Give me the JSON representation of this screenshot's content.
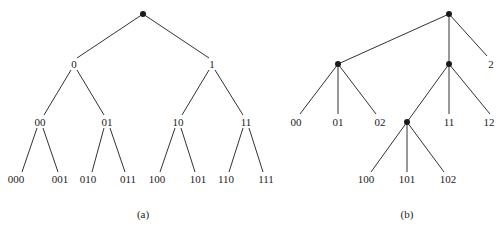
{
  "figure": {
    "panel_a": {
      "caption": "(a)",
      "type": "binary-tree",
      "root": {
        "x": 143,
        "y": 14
      },
      "nodes": [
        {
          "id": "0",
          "label": "0",
          "x": 74,
          "y": 64,
          "parent": "root"
        },
        {
          "id": "1",
          "label": "1",
          "x": 212,
          "y": 64,
          "parent": "root"
        },
        {
          "id": "00",
          "label": "00",
          "x": 40,
          "y": 122,
          "parent": "0"
        },
        {
          "id": "01",
          "label": "01",
          "x": 107,
          "y": 122,
          "parent": "0"
        },
        {
          "id": "10",
          "label": "10",
          "x": 178,
          "y": 122,
          "parent": "1"
        },
        {
          "id": "11",
          "label": "11",
          "x": 246,
          "y": 122,
          "parent": "1"
        },
        {
          "id": "000",
          "label": "000",
          "x": 16,
          "y": 180,
          "parent": "00"
        },
        {
          "id": "001",
          "label": "001",
          "x": 60,
          "y": 180,
          "parent": "00"
        },
        {
          "id": "010",
          "label": "010",
          "x": 88,
          "y": 180,
          "parent": "01"
        },
        {
          "id": "011",
          "label": "011",
          "x": 128,
          "y": 180,
          "parent": "01"
        },
        {
          "id": "100",
          "label": "100",
          "x": 157,
          "y": 180,
          "parent": "10"
        },
        {
          "id": "101",
          "label": "101",
          "x": 198,
          "y": 180,
          "parent": "10"
        },
        {
          "id": "110",
          "label": "110",
          "x": 226,
          "y": 180,
          "parent": "11"
        },
        {
          "id": "111",
          "label": "111",
          "x": 266,
          "y": 180,
          "parent": "11"
        }
      ]
    },
    "panel_b": {
      "caption": "(b)",
      "type": "ternary-prefix-tree",
      "root": {
        "x": 449,
        "y": 14
      },
      "nodes": [
        {
          "id": "b0",
          "label": "",
          "dot": true,
          "x": 338,
          "y": 64,
          "parent": "root"
        },
        {
          "id": "b1",
          "label": "",
          "dot": true,
          "x": 449,
          "y": 64,
          "parent": "root"
        },
        {
          "id": "b2",
          "label": "2",
          "dot": false,
          "x": 491,
          "y": 64,
          "parent": "root"
        },
        {
          "id": "b00",
          "label": "00",
          "dot": false,
          "x": 296,
          "y": 122,
          "parent": "b0"
        },
        {
          "id": "b01",
          "label": "01",
          "dot": false,
          "x": 338,
          "y": 122,
          "parent": "b0"
        },
        {
          "id": "b02",
          "label": "02",
          "dot": false,
          "x": 380,
          "y": 122,
          "parent": "b0"
        },
        {
          "id": "b10",
          "label": "",
          "dot": true,
          "x": 407,
          "y": 122,
          "parent": "b1"
        },
        {
          "id": "b11",
          "label": "11",
          "dot": false,
          "x": 449,
          "y": 122,
          "parent": "b1"
        },
        {
          "id": "b12",
          "label": "12",
          "dot": false,
          "x": 489,
          "y": 122,
          "parent": "b1"
        },
        {
          "id": "b100",
          "label": "100",
          "dot": false,
          "x": 366,
          "y": 180,
          "parent": "b10"
        },
        {
          "id": "b101",
          "label": "101",
          "dot": false,
          "x": 407,
          "y": 180,
          "parent": "b10"
        },
        {
          "id": "b102",
          "label": "102",
          "dot": false,
          "x": 448,
          "y": 180,
          "parent": "b10"
        }
      ]
    }
  }
}
